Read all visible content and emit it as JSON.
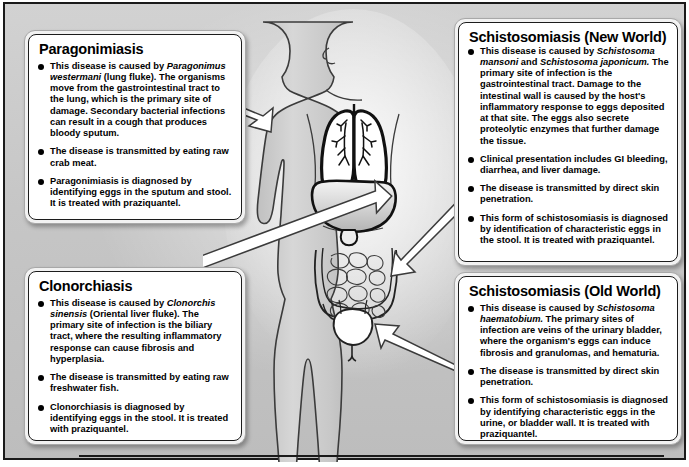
{
  "figure": {
    "colors": {
      "plate_background": "#c9c9c9",
      "panel_background": "#ffffff",
      "panel_frame": "#f2f2f2",
      "border": "#1c1c1c",
      "bullet": "#000000",
      "body_fill": "#c4c4c4",
      "organ_fill": "#ffffff"
    }
  },
  "panels": [
    {
      "id": "paragonimiasis",
      "title": "Paragonimiasis",
      "bullets": [
        {
          "segments": [
            {
              "text": "This disease is caused by ",
              "style": "normal"
            },
            {
              "text": "Paragonimus westermani",
              "style": "italic"
            },
            {
              "text": " (lung fluke). The organisms move from the gastrointestinal tract to the lung, which is the primary site of damage. Secondary bacterial infections can result in a cough that produces bloody sputum.",
              "style": "normal"
            }
          ]
        },
        {
          "segments": [
            {
              "text": "The disease is transmitted by eating raw crab meat.",
              "style": "normal"
            }
          ]
        },
        {
          "segments": [
            {
              "text": "Paragonimiasis is diagnosed by identifying eggs in the sputum and stool. It is treated with praziquantel.",
              "style": "normal"
            }
          ]
        }
      ]
    },
    {
      "id": "clonorchiasis",
      "title": "Clonorchiasis",
      "bullets": [
        {
          "segments": [
            {
              "text": "This disease is caused by ",
              "style": "normal"
            },
            {
              "text": "Clonorchis sinensis",
              "style": "italic"
            },
            {
              "text": " (Oriental liver fluke). The primary site of infection is the biliary tract, where the resulting inflammatory response can cause fibrosis and hyperplasia.",
              "style": "normal"
            }
          ]
        },
        {
          "segments": [
            {
              "text": "The disease is transmitted by eating raw freshwater fish.",
              "style": "normal"
            }
          ]
        },
        {
          "segments": [
            {
              "text": "Clonorchiasis is diagnosed by identifying eggs in the stool. It is treated with praziquantel.",
              "style": "normal"
            }
          ]
        }
      ]
    },
    {
      "id": "schistosomiasis-new-world",
      "title": "Schistosomiasis (New World)",
      "bullets": [
        {
          "segments": [
            {
              "text": "This disease is caused by ",
              "style": "normal"
            },
            {
              "text": "Schistosoma mansoni",
              "style": "italic"
            },
            {
              "text": " and ",
              "style": "normal"
            },
            {
              "text": "Schistosoma japonicum.",
              "style": "italic"
            },
            {
              "text": " The primary site of infection is the gastrointestinal tract. Damage to the intestinal wall is caused by the host's inflammatory response to eggs deposited at that site. The eggs also secrete proteolytic enzymes that further damage the tissue.",
              "style": "normal"
            }
          ]
        },
        {
          "segments": [
            {
              "text": "Clinical presentation includes GI bleeding, diarrhea, and liver damage.",
              "style": "normal"
            }
          ]
        },
        {
          "segments": [
            {
              "text": "The disease is transmitted by direct skin penetration.",
              "style": "normal"
            }
          ]
        },
        {
          "segments": [
            {
              "text": "This form of schistosomiasis is diagnosed by identification of characteristic eggs in the stool. It is treated with praziquantel.",
              "style": "normal"
            }
          ]
        }
      ]
    },
    {
      "id": "schistosomiasis-old-world",
      "title": "Schistosomiasis (Old World)",
      "bullets": [
        {
          "segments": [
            {
              "text": "This disease is caused by ",
              "style": "normal"
            },
            {
              "text": "Schistosoma haematobium.",
              "style": "italic"
            },
            {
              "text": " The primary sites of infection are veins of the urinary bladder, where the organism's eggs can induce fibrosis and granulomas, and hematuria.",
              "style": "normal"
            }
          ]
        },
        {
          "segments": [
            {
              "text": "The disease is transmitted by direct skin penetration.",
              "style": "normal"
            }
          ]
        },
        {
          "segments": [
            {
              "text": "This form of schistosomiasis is diagnosed by identifying characteristic eggs in the urine, or bladder wall. It is treated with praziquantel.",
              "style": "normal"
            }
          ]
        }
      ]
    }
  ],
  "anatomy": {
    "figure_name": "human-body-silhouette",
    "organs": [
      {
        "name": "lungs",
        "label": ""
      },
      {
        "name": "liver",
        "label": ""
      },
      {
        "name": "intestines",
        "label": ""
      },
      {
        "name": "bladder",
        "label": ""
      }
    ],
    "pointers": [
      {
        "name": "arrow-to-lungs",
        "from_panel": "paragonimiasis",
        "to_organ": "lungs"
      },
      {
        "name": "arrow-to-liver",
        "from_panel": "clonorchiasis",
        "to_organ": "liver"
      },
      {
        "name": "arrow-to-intestines",
        "from_panel": "schistosomiasis-new-world",
        "to_organ": "intestines"
      },
      {
        "name": "arrow-to-bladder",
        "from_panel": "schistosomiasis-old-world",
        "to_organ": "bladder"
      }
    ]
  }
}
